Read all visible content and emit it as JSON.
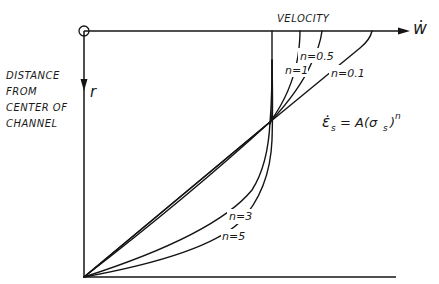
{
  "figure": {
    "axis_top_label": "VELOCITY",
    "axis_top_symbol": "ẇ",
    "axis_left_symbol": "r",
    "axis_left_label_lines": [
      "DISTANCE",
      "FROM",
      "CENTER OF",
      "CHANNEL"
    ],
    "origin_marker": "O",
    "equation": {
      "lhs": "ε̇",
      "lhs_sub": "s",
      "mid": "= A(σ",
      "mid_sub": "s",
      "rhs": ")",
      "exponent": "n"
    },
    "curve_labels": [
      {
        "id": "n01",
        "text": "n=0.1"
      },
      {
        "id": "n05",
        "text": "n=0.5"
      },
      {
        "id": "n1",
        "text": "n=1"
      },
      {
        "id": "n3",
        "text": "n=3"
      },
      {
        "id": "n5",
        "text": "n=5"
      }
    ]
  },
  "colors": {
    "ink": "#141414",
    "background": "#ffffff"
  }
}
